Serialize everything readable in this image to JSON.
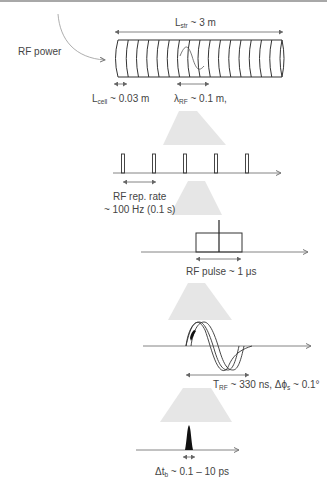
{
  "diagram": {
    "rf_power_label": "RF power",
    "structure": {
      "length_label_main": "L",
      "length_label_sub": "str",
      "length_label_value": " ~ 3 m",
      "cell_count": 16
    },
    "cell": {
      "label_main": "L",
      "label_sub": "cell",
      "label_value": " ~ 0.03 m"
    },
    "wavelength": {
      "label_main": "λ",
      "label_sub": "RF",
      "label_value": " ~ 0.1 m,"
    },
    "rep_rate": {
      "line1": "RF rep. rate",
      "line2": "~ 100 Hz (0.1 s)",
      "pulse_count": 5
    },
    "rf_pulse": {
      "label": "RF pulse ~ 1 μs"
    },
    "rf_period": {
      "label_main": "T",
      "label_sub": "RF",
      "label_value": " ~ 330 ns, Δϕ",
      "phase_sub": "s",
      "phase_value": " ~ 0.1°"
    },
    "bunch": {
      "label_main": "Δt",
      "label_sub": "b",
      "label_value": " ~ 0.1 – 10 ps"
    }
  }
}
